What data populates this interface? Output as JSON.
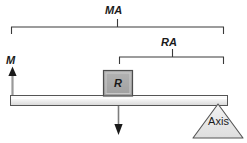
{
  "diagram": {
    "background_color": "#ffffff",
    "line_color": "#3a3a3a",
    "text_color": "#1a1a1a",
    "labels": {
      "effort_arm": "MA",
      "resistance_arm": "RA",
      "effort_force": "M",
      "resistance_block": "R",
      "fulcrum": "Axis"
    },
    "brackets": [
      {
        "name": "effort-arm-bracket",
        "label": "MA",
        "x_start": 11,
        "x_end": 224,
        "y": 27,
        "tick_x": 117
      },
      {
        "name": "resistance-arm-bracket",
        "label": "RA",
        "x_start": 119,
        "x_end": 224,
        "y": 57,
        "tick_x": 172
      }
    ],
    "beam": {
      "name": "lever-beam",
      "x": 10,
      "y": 95,
      "width": 218,
      "height": 10,
      "fill_top": "#ffffff",
      "fill_bottom": "#dcdcdc",
      "stroke": "#555555"
    },
    "block": {
      "name": "resistance-block",
      "label": "R",
      "x": 103,
      "y": 70,
      "width": 30,
      "height": 26,
      "fill": "#a6a6a6",
      "stroke": "#4d4d4d",
      "inner_stroke": "#d9d9d9"
    },
    "arrows": [
      {
        "name": "effort-force-arrow",
        "label": "M",
        "direction": "up",
        "x": 12,
        "y_tail": 96,
        "y_head": 67,
        "color": "#1a1a1a"
      },
      {
        "name": "resistance-force-arrow",
        "label": "",
        "direction": "down",
        "x": 118,
        "y_tail": 106,
        "y_head": 135,
        "color": "#1a1a1a"
      }
    ],
    "fulcrum": {
      "name": "axis-fulcrum",
      "label": "Axis",
      "apex_x": 218,
      "apex_y": 104,
      "base_left_x": 193,
      "base_right_x": 243,
      "base_y": 138,
      "fill": "#e8e8e8",
      "stroke": "#555555"
    }
  }
}
